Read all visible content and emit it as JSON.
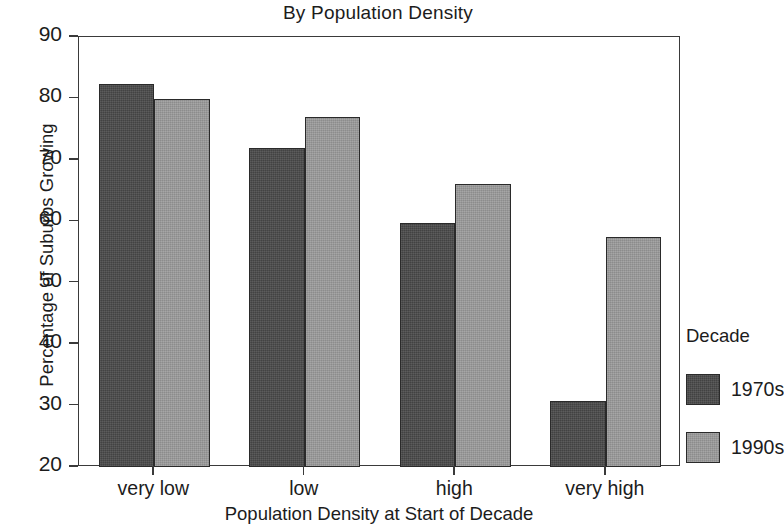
{
  "chart_data": {
    "type": "bar",
    "title": "By Population Density",
    "xlabel": "Population Density at Start of Decade",
    "ylabel": "Percentage of Suburbs Growing",
    "categories": [
      "very low",
      "low",
      "high",
      "very high"
    ],
    "series": [
      {
        "name": "1970s",
        "color": "#4a4a4a",
        "values": [
          82.3,
          72.0,
          59.8,
          30.8
        ]
      },
      {
        "name": "1990s",
        "color": "#9c9c9c",
        "values": [
          79.9,
          77.0,
          66.0,
          57.5
        ]
      }
    ],
    "ylim": [
      20,
      90
    ],
    "ytick_values": [
      20,
      30,
      40,
      50,
      60,
      70,
      80,
      90
    ],
    "ytick_labels": [
      "20",
      "30",
      "40",
      "50",
      "60",
      "70",
      "80",
      "90"
    ],
    "grid": false,
    "legend": {
      "title": "Decade",
      "position": "right",
      "entries": [
        "1970s",
        "1990s"
      ]
    }
  }
}
